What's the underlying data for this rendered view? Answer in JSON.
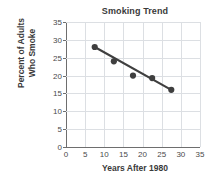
{
  "chart_data": {
    "type": "scatter",
    "title": "Smoking Trend",
    "xlabel": "Years After 1980",
    "ylabel": "Percent of Adults Who Smoke",
    "ylabel_lines": [
      "Percent of Adults",
      "Who Smoke"
    ],
    "xlim": [
      0,
      35
    ],
    "ylim": [
      0,
      35
    ],
    "xticks": [
      0,
      5,
      10,
      15,
      20,
      25,
      30,
      35
    ],
    "yticks": [
      0,
      5,
      10,
      15,
      20,
      25,
      30,
      35
    ],
    "grid": true,
    "legend": null,
    "series": [
      {
        "name": "Percent of adults who smoke",
        "marker": "filled-circle",
        "color": "#3f3f3f",
        "points": [
          {
            "x": 7.5,
            "y": 28.0
          },
          {
            "x": 12.5,
            "y": 24.0
          },
          {
            "x": 17.5,
            "y": 20.0
          },
          {
            "x": 22.5,
            "y": 19.3
          },
          {
            "x": 27.5,
            "y": 16.0
          }
        ]
      },
      {
        "name": "Trend line",
        "type": "line",
        "color": "#3f3f3f",
        "points": [
          {
            "x": 7.5,
            "y": 28.0
          },
          {
            "x": 27.5,
            "y": 16.0
          }
        ]
      }
    ]
  }
}
